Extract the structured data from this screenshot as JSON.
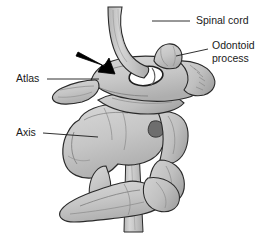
{
  "figure": {
    "background_color": "#ffffff",
    "line_color": "#1a1a1a",
    "bone_fill_color": "#c9c9c9",
    "bone_shadow_color": "#a9a9a9",
    "bone_highlight_color": "#dcdcdc",
    "cord_fill_color": "#c4c4c4",
    "foramen_fill_color": "#ffffff",
    "arrow_color": "#000000"
  },
  "labels": [
    {
      "id": "spinal-cord",
      "text": "Spinal cord",
      "lines": [
        "Spinal cord"
      ],
      "x": 196,
      "y": 21,
      "leader": {
        "x1": 190,
        "y1": 21,
        "x2": 152,
        "y2": 21
      }
    },
    {
      "id": "odontoid-process",
      "text": "Odontoid process",
      "lines": [
        "Odontoid",
        "process"
      ],
      "x": 212,
      "y": 52,
      "leader": {
        "x1": 208,
        "y1": 49,
        "x2": 176,
        "y2": 56
      }
    },
    {
      "id": "atlas",
      "text": "Atlas",
      "lines": [
        "Atlas"
      ],
      "x": 16,
      "y": 79,
      "leader": {
        "x1": 47,
        "y1": 79,
        "x2": 97,
        "y2": 79
      }
    },
    {
      "id": "axis",
      "text": "Axis",
      "lines": [
        "Axis"
      ],
      "x": 16,
      "y": 133,
      "leader": {
        "x1": 43,
        "y1": 133,
        "x2": 96,
        "y2": 137
      }
    }
  ],
  "annotations": [
    {
      "id": "compression-arrow",
      "kind": "arrow",
      "description": "Black arrow pointing down-right toward the spinal cord at the atlas",
      "tail": {
        "x": 78,
        "y": 53
      },
      "tip": {
        "x": 113,
        "y": 73
      },
      "color": "#000000"
    }
  ],
  "structures": [
    {
      "id": "spinal-cord-upper",
      "name": "Spinal cord (upper segment)"
    },
    {
      "id": "spinal-cord-lower",
      "name": "Spinal cord (lower segment)"
    },
    {
      "id": "odontoid-process-bone",
      "name": "Odontoid process (dens)"
    },
    {
      "id": "atlas-bone",
      "name": "Atlas (C1 vertebra)"
    },
    {
      "id": "atlas-foramen",
      "name": "Vertebral foramen of atlas"
    },
    {
      "id": "axis-bone",
      "name": "Axis (C2 vertebra)"
    },
    {
      "id": "axis-spinous-process",
      "name": "Spinous process of axis"
    },
    {
      "id": "axis-transverse-process",
      "name": "Transverse process of axis"
    },
    {
      "id": "lower-vertebra",
      "name": "Lower cervical vertebra"
    }
  ]
}
